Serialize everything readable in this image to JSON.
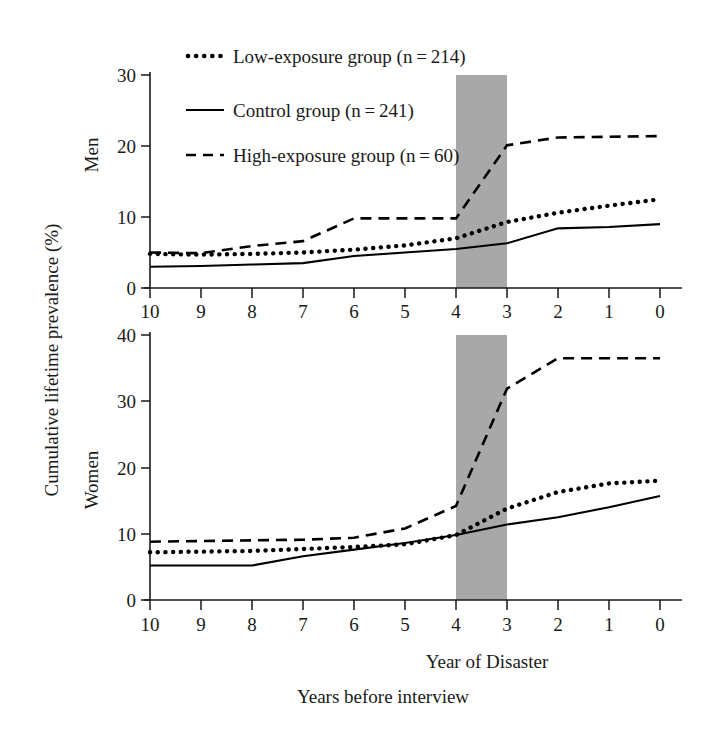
{
  "figure": {
    "y_axis_title": "Cumulative lifetime prevalence (%)",
    "x_axis_title": "Year of Disaster",
    "x_axis_subtitle": "Years before interview",
    "band_color": "#a8a8a8",
    "line_color": "#000000"
  },
  "legend": {
    "position": "top-left-inside",
    "entries": [
      {
        "label": "Low-exposure group (n = 214)",
        "style": "dotted",
        "marker": "dotted-line-marker"
      },
      {
        "label": "Control group (n = 241)",
        "style": "solid",
        "marker": "solid-line-marker"
      },
      {
        "label": "High-exposure group (n = 60)",
        "style": "dashed",
        "marker": "dashed-line-marker"
      }
    ]
  },
  "panels": [
    {
      "id": "men",
      "label": "Men",
      "ylim": [
        0,
        30
      ],
      "yticks": [
        0,
        10,
        20,
        30
      ]
    },
    {
      "id": "women",
      "label": "Women",
      "ylim": [
        0,
        40
      ],
      "yticks": [
        0,
        10,
        20,
        30,
        40
      ]
    }
  ],
  "chart_data": {
    "type": "line",
    "title": "",
    "xlabel": "Year of Disaster",
    "xlabel_secondary": "Years before interview",
    "ylabel": "Cumulative lifetime prevalence (%)",
    "x": [
      10,
      9,
      8,
      7,
      6,
      5,
      4,
      3,
      2,
      1,
      0
    ],
    "xlim": [
      10,
      0
    ],
    "x_axis_inverted": true,
    "xticks": [
      10,
      9,
      8,
      7,
      6,
      5,
      4,
      3,
      2,
      1,
      0
    ],
    "grid": false,
    "legend_position": "upper left",
    "shaded_band": {
      "from": 4,
      "to": 3,
      "label": "disaster year",
      "color": "#a8a8a8"
    },
    "panels": [
      {
        "name": "Men",
        "ylim": [
          0,
          30
        ],
        "yticks": [
          0,
          10,
          20,
          30
        ],
        "series": [
          {
            "name": "Low-exposure group (n = 214)",
            "style": "dotted",
            "n": 214,
            "values": [
              4.8,
              4.7,
              4.8,
              5.0,
              5.4,
              6.0,
              7.0,
              9.3,
              10.6,
              11.6,
              12.5
            ]
          },
          {
            "name": "Control group (n = 241)",
            "style": "solid",
            "n": 241,
            "values": [
              3.0,
              3.1,
              3.3,
              3.5,
              4.5,
              5.0,
              5.5,
              6.3,
              8.4,
              8.6,
              9.0
            ]
          },
          {
            "name": "High-exposure group (n = 60)",
            "style": "dashed",
            "n": 60,
            "values": [
              5.0,
              4.9,
              5.9,
              6.6,
              9.8,
              9.8,
              9.8,
              20.1,
              21.2,
              21.3,
              21.4
            ]
          }
        ]
      },
      {
        "name": "Women",
        "ylim": [
          0,
          40
        ],
        "yticks": [
          0,
          10,
          20,
          30,
          40
        ],
        "series": [
          {
            "name": "Low-exposure group (n = 214)",
            "style": "dotted",
            "n": 214,
            "values": [
              7.2,
              7.3,
              7.4,
              7.7,
              8.0,
              8.4,
              9.8,
              13.8,
              16.3,
              17.6,
              18.0
            ]
          },
          {
            "name": "Control group (n = 241)",
            "style": "solid",
            "n": 241,
            "values": [
              5.2,
              5.2,
              5.2,
              6.6,
              7.6,
              8.6,
              9.8,
              11.4,
              12.5,
              14.0,
              15.7
            ]
          },
          {
            "name": "High-exposure group (n = 60)",
            "style": "dashed",
            "n": 60,
            "values": [
              8.8,
              8.9,
              9.0,
              9.1,
              9.4,
              10.8,
              14.2,
              31.9,
              36.5,
              36.5,
              36.5
            ]
          }
        ]
      }
    ]
  }
}
